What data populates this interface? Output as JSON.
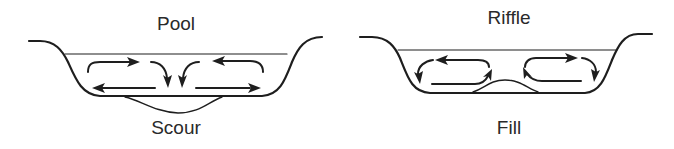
{
  "diagram": {
    "panels": [
      {
        "id": "pool",
        "title": "Pool",
        "bed_feature": "Scour",
        "flow_description": "Secondary circulation converges at surface center and descends, scouring the bed"
      },
      {
        "id": "riffle",
        "title": "Riffle",
        "bed_feature": "Fill",
        "flow_description": "Secondary circulation rises at channel center over deposited fill"
      }
    ],
    "colors": {
      "line": "#1e1e1e",
      "text": "#2a2a2a",
      "background": "#ffffff"
    }
  }
}
